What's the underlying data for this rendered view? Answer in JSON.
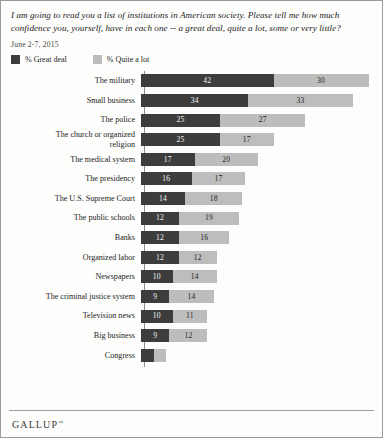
{
  "header": {
    "question": "I am going to read you a list of institutions in American society. Please tell me how much confidence you, yourself, have in each one -- a great deal, quite a lot, some or very little?",
    "date": "June 2-7, 2015"
  },
  "legend": {
    "great_deal": "% Great deal",
    "quite_a_lot": "% Quite a lot"
  },
  "footer": {
    "brand": "GALLUP",
    "trademark": "™"
  },
  "colors": {
    "great_deal": "#3d3d3d",
    "quite_a_lot": "#bdbdbd",
    "background": "#fdfdfc",
    "border": "#9a9a9a"
  },
  "chart_data": {
    "type": "bar",
    "orientation": "horizontal",
    "stacked": true,
    "title": "I am going to read you a list of institutions in American society. Please tell me how much confidence you, yourself, have in each one -- a great deal, quite a lot, some or very little?",
    "subtitle": "June 2-7, 2015",
    "xlabel": "",
    "ylabel": "",
    "xlim": [
      0,
      72
    ],
    "grid": false,
    "legend_position": "top-left",
    "categories": [
      "The military",
      "Small business",
      "The police",
      "The church or organized religion",
      "The medical system",
      "The presidency",
      "The U.S. Supreme Court",
      "The public schools",
      "Banks",
      "Organized labor",
      "Newspapers",
      "The criminal justice system",
      "Television news",
      "Big business",
      "Congress"
    ],
    "series": [
      {
        "name": "% Great deal",
        "color": "#3d3d3d",
        "values": [
          42,
          34,
          25,
          25,
          17,
          16,
          14,
          12,
          12,
          12,
          10,
          9,
          10,
          9,
          4
        ]
      },
      {
        "name": "% Quite a lot",
        "color": "#bdbdbd",
        "values": [
          30,
          33,
          27,
          17,
          20,
          17,
          18,
          19,
          16,
          12,
          14,
          14,
          11,
          12,
          4
        ]
      }
    ],
    "rows": [
      {
        "label": "The military",
        "great_deal": 42,
        "quite_a_lot": 30,
        "great_deal_label": "42",
        "quite_a_lot_label": "30"
      },
      {
        "label": "Small business",
        "great_deal": 34,
        "quite_a_lot": 33,
        "great_deal_label": "34",
        "quite_a_lot_label": "33"
      },
      {
        "label": "The police",
        "great_deal": 25,
        "quite_a_lot": 27,
        "great_deal_label": "25",
        "quite_a_lot_label": "27"
      },
      {
        "label": "The church or organized\nreligion",
        "great_deal": 25,
        "quite_a_lot": 17,
        "great_deal_label": "25",
        "quite_a_lot_label": "17"
      },
      {
        "label": "The medical system",
        "great_deal": 17,
        "quite_a_lot": 20,
        "great_deal_label": "17",
        "quite_a_lot_label": "20"
      },
      {
        "label": "The presidency",
        "great_deal": 16,
        "quite_a_lot": 17,
        "great_deal_label": "16",
        "quite_a_lot_label": "17"
      },
      {
        "label": "The U.S. Supreme Court",
        "great_deal": 14,
        "quite_a_lot": 18,
        "great_deal_label": "14",
        "quite_a_lot_label": "18"
      },
      {
        "label": "The public schools",
        "great_deal": 12,
        "quite_a_lot": 19,
        "great_deal_label": "12",
        "quite_a_lot_label": "19"
      },
      {
        "label": "Banks",
        "great_deal": 12,
        "quite_a_lot": 16,
        "great_deal_label": "12",
        "quite_a_lot_label": "16"
      },
      {
        "label": "Organized labor",
        "great_deal": 12,
        "quite_a_lot": 12,
        "great_deal_label": "12",
        "quite_a_lot_label": "12"
      },
      {
        "label": "Newspapers",
        "great_deal": 10,
        "quite_a_lot": 14,
        "great_deal_label": "10",
        "quite_a_lot_label": "14"
      },
      {
        "label": "The criminal justice system",
        "great_deal": 9,
        "quite_a_lot": 14,
        "great_deal_label": "9",
        "quite_a_lot_label": "14"
      },
      {
        "label": "Television news",
        "great_deal": 10,
        "quite_a_lot": 11,
        "great_deal_label": "10",
        "quite_a_lot_label": "11"
      },
      {
        "label": "Big business",
        "great_deal": 9,
        "quite_a_lot": 12,
        "great_deal_label": "9",
        "quite_a_lot_label": "12"
      },
      {
        "label": "Congress",
        "great_deal": 4,
        "quite_a_lot": 4,
        "great_deal_label": "",
        "quite_a_lot_label": ""
      }
    ]
  }
}
